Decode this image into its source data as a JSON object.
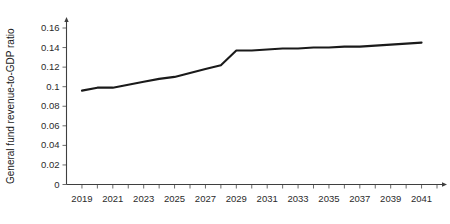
{
  "chart_data": {
    "type": "line",
    "title": "",
    "subtitle": "",
    "xlabel": "",
    "ylabel": "General fund revenue-to-GDP ratio",
    "xlim": [
      2018,
      2042
    ],
    "ylim": [
      0,
      0.16
    ],
    "grid": false,
    "legend": null,
    "x": [
      2019,
      2020,
      2021,
      2022,
      2023,
      2024,
      2025,
      2026,
      2027,
      2028,
      2029,
      2030,
      2031,
      2032,
      2033,
      2034,
      2035,
      2036,
      2037,
      2038,
      2039,
      2040,
      2041
    ],
    "series": [
      {
        "name": "General fund revenue-to-GDP ratio",
        "color": "#1a1a1a",
        "values": [
          0.096,
          0.099,
          0.099,
          0.102,
          0.105,
          0.108,
          0.11,
          0.114,
          0.118,
          0.122,
          0.137,
          0.137,
          0.138,
          0.139,
          0.139,
          0.14,
          0.14,
          0.141,
          0.141,
          0.142,
          0.143,
          0.144,
          0.145
        ]
      }
    ],
    "x_tick_values": [
      2019,
      2021,
      2023,
      2025,
      2027,
      2029,
      2031,
      2033,
      2035,
      2037,
      2039,
      2041
    ],
    "x_tick_labels": [
      "2019",
      "2021",
      "2023",
      "2025",
      "2027",
      "2029",
      "2031",
      "2033",
      "2035",
      "2037",
      "2039",
      "2041"
    ],
    "x_minor_ticks": [
      2018,
      2019,
      2020,
      2021,
      2022,
      2023,
      2024,
      2025,
      2026,
      2027,
      2028,
      2029,
      2030,
      2031,
      2032,
      2033,
      2034,
      2035,
      2036,
      2037,
      2038,
      2039,
      2040,
      2041,
      2042
    ],
    "y_tick_values": [
      0,
      0.02,
      0.04,
      0.06,
      0.08,
      0.1,
      0.12,
      0.14,
      0.16
    ],
    "y_tick_labels": [
      "0",
      "0.02",
      "0.04",
      "0.06",
      "0.08",
      "0.1",
      "0.12",
      "0.14",
      "0.16"
    ]
  },
  "axes": {
    "y_title": "General fund revenue-to-GDP ratio",
    "x_title": ""
  },
  "colors": {
    "series": "#1a1a1a",
    "axis": "#3f3f3f",
    "tick": "#6b6b6b",
    "text": "#2b2b2b",
    "background": "#ffffff"
  }
}
